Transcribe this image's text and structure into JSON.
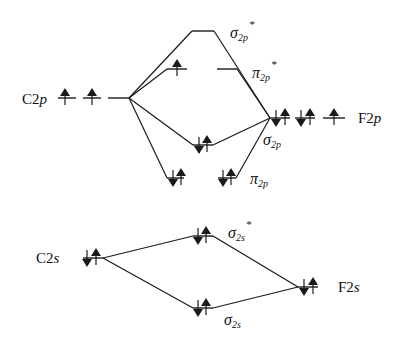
{
  "colors": {
    "ink": "#1a1a1a",
    "background": "#ffffff"
  },
  "atomic_orbitals": {
    "c2p": {
      "label_main": "C2",
      "label_sub": "p",
      "electrons": "2 unpaired (↑ ↑ _)"
    },
    "f2p": {
      "label_main": "F2",
      "label_sub": "p",
      "electrons": "↑↓ ↑↓ ↑"
    },
    "c2s": {
      "label_main": "C2",
      "label_sub": "s",
      "electrons": "↑↓"
    },
    "f2s": {
      "label_main": "F2",
      "label_sub": "s",
      "electrons": "↑↓"
    }
  },
  "molecular_orbitals": {
    "sigma2p_star": {
      "symbol": "σ",
      "sub": "2p",
      "sup": "*",
      "electrons": "empty"
    },
    "pi2p_star": {
      "symbol": "π",
      "sub": "2p",
      "sup": "*",
      "electrons": "↑ (one level), other empty"
    },
    "sigma2p": {
      "symbol": "σ",
      "sub": "2p",
      "sup": "",
      "electrons": "↑↓"
    },
    "pi2p": {
      "symbol": "π",
      "sub": "2p",
      "sup": "",
      "electrons": "↑↓ ↑↓"
    },
    "sigma2s_star": {
      "symbol": "σ",
      "sub": "2s",
      "sup": "*",
      "electrons": "↑↓"
    },
    "sigma2s": {
      "symbol": "σ",
      "sub": "2s",
      "sup": "",
      "electrons": "↑↓"
    }
  }
}
